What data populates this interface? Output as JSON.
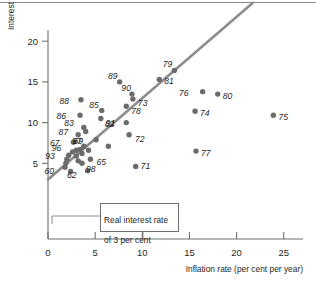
{
  "chart_data": {
    "type": "scatter",
    "title": "",
    "xlabel": "Inflation rate (per cent per year)",
    "ylabel": "Interest rate (per cent per year)",
    "xlim": [
      0,
      27.5
    ],
    "ylim": [
      0,
      22.5
    ],
    "xticks": [
      0,
      5,
      10,
      15,
      20,
      25
    ],
    "yticks": [
      5,
      10,
      15,
      20
    ],
    "xtick_labels": [
      "0",
      "5",
      "10",
      "15",
      "20",
      "25"
    ],
    "ytick_labels": [
      "5",
      "10",
      "15",
      "20"
    ],
    "grid": false,
    "legend": null,
    "annotation": {
      "text": "Real interest rate\nof 3 per cent",
      "line_label": "Real interest rate of 3 per cent"
    },
    "reference_line": {
      "name": "real-interest-rate-3-percent",
      "equation": "interest = inflation + 3",
      "x_start": 0.0,
      "y_start": 3.0,
      "x_end": 21.7,
      "y_end": 24.7,
      "color": "#8c8c8c"
    },
    "point_color": "#6b6b6b",
    "points": [
      {
        "label": "60",
        "x": 1.8,
        "y": 4.5,
        "label_dx": -11,
        "label_dy": 4
      },
      {
        "label": "61",
        "x": 1.9,
        "y": 5.0,
        "label_dx": 0,
        "label_dy": 0,
        "label_hidden": true
      },
      {
        "label": "62",
        "x": 4.2,
        "y": 4.1,
        "label_dx": -11,
        "label_dy": 4
      },
      {
        "label": "63",
        "x": 2.4,
        "y": 4.0,
        "label_dx": 0,
        "label_dy": 0,
        "label_hidden": true
      },
      {
        "label": "64",
        "x": 3.2,
        "y": 5.3,
        "label_dx": 0,
        "label_dy": 0,
        "label_hidden": true
      },
      {
        "label": "65",
        "x": 4.5,
        "y": 5.5,
        "label_dx": 6,
        "label_dy": 3
      },
      {
        "label": "66",
        "x": 3.6,
        "y": 6.2,
        "label_dx": 0,
        "label_dy": 0,
        "label_hidden": true
      },
      {
        "label": "67",
        "x": 2.7,
        "y": 7.6,
        "label_dx": -14,
        "label_dy": 1
      },
      {
        "label": "68",
        "x": 3.4,
        "y": 6.7,
        "label_dx": 0,
        "label_dy": 0,
        "label_hidden": true
      },
      {
        "label": "69",
        "x": 5.1,
        "y": 7.9,
        "label_dx": -13,
        "label_dy": 1
      },
      {
        "label": "70",
        "x": 6.4,
        "y": 7.1,
        "label_dx": 0,
        "label_dy": 0,
        "label_hidden": true
      },
      {
        "label": "71",
        "x": 9.3,
        "y": 4.6,
        "label_dx": 5,
        "label_dy": -1
      },
      {
        "label": "72",
        "x": 8.6,
        "y": 8.5,
        "label_dx": 6,
        "label_dy": 4
      },
      {
        "label": "73",
        "x": 9.0,
        "y": 12.9,
        "label_dx": 5,
        "label_dy": 4
      },
      {
        "label": "74",
        "x": 15.6,
        "y": 11.4,
        "label_dx": 5,
        "label_dy": 2
      },
      {
        "label": "75",
        "x": 23.9,
        "y": 10.9,
        "label_dx": 5,
        "label_dy": 2
      },
      {
        "label": "76",
        "x": 16.4,
        "y": 13.8,
        "label_dx": -14,
        "label_dy": 1
      },
      {
        "label": "77",
        "x": 15.7,
        "y": 6.5,
        "label_dx": 5,
        "label_dy": 2
      },
      {
        "label": "78",
        "x": 8.3,
        "y": 12.0,
        "label_dx": 5,
        "label_dy": 5
      },
      {
        "label": "79",
        "x": 13.4,
        "y": 16.4,
        "label_dx": -2,
        "label_dy": -7
      },
      {
        "label": "80",
        "x": 18.0,
        "y": 13.5,
        "label_dx": 5,
        "label_dy": 2
      },
      {
        "label": "81",
        "x": 11.8,
        "y": 15.3,
        "label_dx": 5,
        "label_dy": 2
      },
      {
        "label": "82",
        "x": 8.3,
        "y": 10.0,
        "label_dx": -12,
        "label_dy": 1
      },
      {
        "label": "83",
        "x": 3.8,
        "y": 9.4,
        "label_dx": -10,
        "label_dy": -4
      },
      {
        "label": "85",
        "x": 5.7,
        "y": 11.5,
        "label_dx": -3,
        "label_dy": -5
      },
      {
        "label": "86",
        "x": 3.4,
        "y": 10.9,
        "label_dx": -14,
        "label_dy": 1
      },
      {
        "label": "87",
        "x": 3.2,
        "y": 8.5,
        "label_dx": -10,
        "label_dy": -3
      },
      {
        "label": "88",
        "x": 3.5,
        "y": 12.8,
        "label_dx": -12,
        "label_dy": 1
      },
      {
        "label": "89",
        "x": 7.6,
        "y": 15.0,
        "label_dx": -2,
        "label_dy": -6
      },
      {
        "label": "90",
        "x": 8.9,
        "y": 13.5,
        "label_dx": -1,
        "label_dy": -6
      },
      {
        "label": "91",
        "x": 5.6,
        "y": 10.5,
        "label_dx": 5,
        "label_dy": 4
      },
      {
        "label": "93",
        "x": 2.2,
        "y": 6.0,
        "label_dx": -14,
        "label_dy": 1
      },
      {
        "label": "96",
        "x": 3.0,
        "y": 6.6,
        "label_dx": -15,
        "label_dy": -2
      },
      {
        "label": "97",
        "x": 3.8,
        "y": 7.1,
        "label_dx": -2,
        "label_dy": -5
      },
      {
        "label": "98",
        "x": 3.6,
        "y": 5.0,
        "label_dx": 4,
        "label_dy": 6
      },
      {
        "label": "92",
        "x": 2.0,
        "y": 5.5,
        "label_dx": 0,
        "label_dy": 0,
        "label_hidden": true
      },
      {
        "label": "94",
        "x": 2.6,
        "y": 6.4,
        "label_dx": 0,
        "label_dy": 0,
        "label_hidden": true
      },
      {
        "label": "95",
        "x": 3.0,
        "y": 5.9,
        "label_dx": 0,
        "label_dy": 0,
        "label_hidden": true
      },
      {
        "label": "84",
        "x": 4.0,
        "y": 8.9,
        "label_dx": 0,
        "label_dy": 0,
        "label_hidden": true
      },
      {
        "label": "99",
        "x": 4.3,
        "y": 6.6,
        "label_dx": 0,
        "label_dy": 0,
        "label_hidden": true
      }
    ]
  },
  "axes": {
    "x_title": "Inflation rate (per cent per year)",
    "y_title": "Interest rate (per cent per year)",
    "x_tick_labels": [
      "0",
      "5",
      "10",
      "15",
      "20",
      "25"
    ],
    "y_tick_labels": [
      "5",
      "10",
      "15",
      "20"
    ]
  },
  "callout": {
    "line1": "Real interest rate",
    "line2": "of 3 per cent"
  }
}
